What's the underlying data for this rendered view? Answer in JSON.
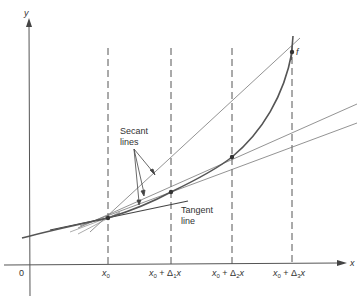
{
  "figure": {
    "axes": {
      "x_label": "x",
      "y_label": "y",
      "origin_label": "0"
    },
    "tick_labels": [
      {
        "base": "x",
        "sub": "0",
        "rest": ""
      },
      {
        "base": "x",
        "sub": "0",
        "rest": " + Δ",
        "sub2": "1",
        "tail": "x"
      },
      {
        "base": "x",
        "sub": "0",
        "rest": " + Δ",
        "sub2": "2",
        "tail": "x"
      },
      {
        "base": "x",
        "sub": "0",
        "rest": " + Δ",
        "sub2": "3",
        "tail": "x"
      }
    ],
    "annotations": {
      "secant_line1": "Secant",
      "secant_line2": "lines",
      "tangent_line1": "Tangent",
      "tangent_line2": "line",
      "curve_label": "f"
    },
    "colors": {
      "curve": "#555555",
      "lines": "#666666",
      "text": "#333333"
    }
  }
}
